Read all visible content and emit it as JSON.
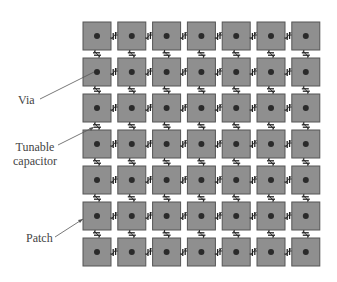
{
  "figure": {
    "grid": {
      "rows": 7,
      "cols": 7
    },
    "colors": {
      "patch_fill": "#8f8f8f",
      "patch_border": "#555555",
      "via": "#2a2a2a",
      "capacitor": "#222222",
      "leader_line": "#555555",
      "label_text": "#444444",
      "background": "#ffffff"
    },
    "labels": {
      "via": "Via",
      "capacitor_line1": "Tunable",
      "capacitor_line2": "capacitor",
      "patch": "Patch"
    }
  }
}
